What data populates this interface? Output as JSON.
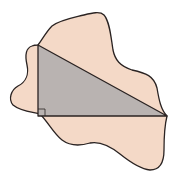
{
  "figure": {
    "colors": {
      "blob_fill": "#f4d9c7",
      "triangle_fill": "#b9b3b1",
      "stroke": "#2a2322",
      "background": "#ffffff"
    },
    "triangle": {
      "vertices": [
        [
          38,
          45
        ],
        [
          38,
          116
        ],
        [
          167,
          116
        ]
      ],
      "right_angle_at": [
        38,
        116
      ],
      "right_angle_marker_size": 7
    }
  }
}
